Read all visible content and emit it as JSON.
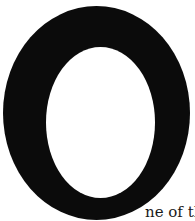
{
  "document": {
    "drop_cap_letter": "O",
    "text_continuation": "ne of the",
    "colors": {
      "ink": "#0b0b0b",
      "paper": "#ffffff"
    }
  }
}
